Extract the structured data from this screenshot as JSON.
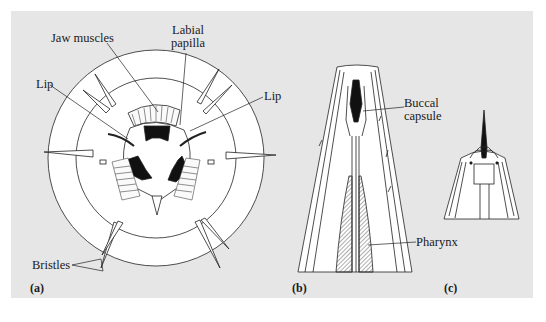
{
  "figure": {
    "background_color": "#e6e6e6",
    "panels": [
      {
        "id": "a",
        "letter": "(a)",
        "view": "en face view of nematode head",
        "labels": {
          "jaw_muscles": "Jaw muscles",
          "labial_papilla_line1": "Labial",
          "labial_papilla_line2": "papilla",
          "lip_left": "Lip",
          "lip_right": "Lip",
          "bristles": "Bristles"
        }
      },
      {
        "id": "b",
        "letter": "(b)",
        "view": "longitudinal section of anterior end",
        "labels": {
          "buccal_capsule_line1": "Buccal",
          "buccal_capsule_line2": "capsule",
          "pharynx": "Pharynx"
        }
      },
      {
        "id": "c",
        "letter": "(c)",
        "view": "anterior end with stylet",
        "labels": {}
      }
    ]
  }
}
